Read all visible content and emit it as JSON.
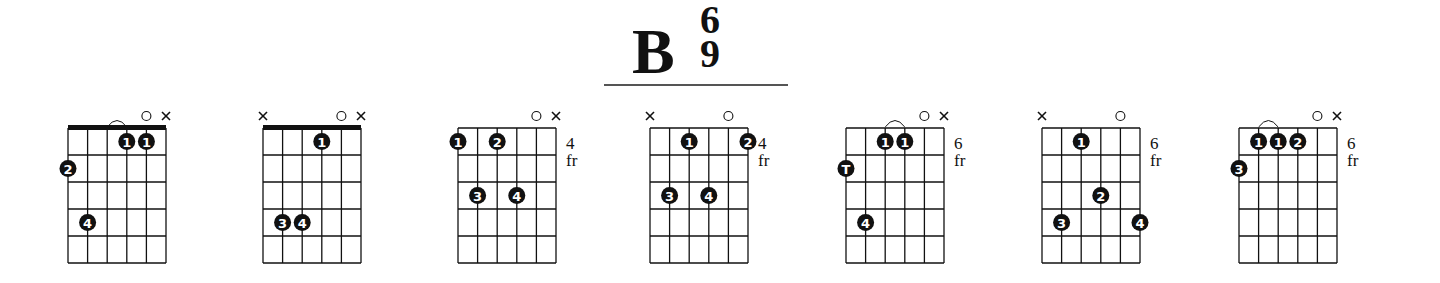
{
  "title": {
    "root": "B",
    "superscript": "6",
    "subscript": "9"
  },
  "grid": {
    "strings": 6,
    "frets": 5,
    "col_spacing": 19.6,
    "row_spacing": 27
  },
  "colors": {
    "ink": "#111111",
    "finger_fill": "#111111",
    "finger_text": "#ffffff"
  },
  "chords": [
    {
      "x": 68,
      "nut": true,
      "fret_label": "",
      "markers": [
        "",
        "",
        "",
        "",
        "open",
        "mute"
      ],
      "barre_arc": [
        2,
        3
      ],
      "fingers": [
        {
          "string": 3,
          "fret": 1,
          "label": "1"
        },
        {
          "string": 4,
          "fret": 1,
          "label": "1"
        },
        {
          "string": 0,
          "fret": 2,
          "label": "2"
        },
        {
          "string": 1,
          "fret": 4,
          "label": "4"
        }
      ]
    },
    {
      "x": 263,
      "nut": true,
      "fret_label": "",
      "markers": [
        "mute",
        "",
        "",
        "",
        "open",
        "mute"
      ],
      "barre_arc": null,
      "fingers": [
        {
          "string": 3,
          "fret": 1,
          "label": "1"
        },
        {
          "string": 1,
          "fret": 4,
          "label": "3"
        },
        {
          "string": 2,
          "fret": 4,
          "label": "4"
        }
      ]
    },
    {
      "x": 458,
      "nut": false,
      "fret_label": "4 fr",
      "markers": [
        "",
        "",
        "",
        "",
        "open",
        "mute"
      ],
      "barre_arc": null,
      "fingers": [
        {
          "string": 0,
          "fret": 1,
          "label": "1"
        },
        {
          "string": 2,
          "fret": 1,
          "label": "2"
        },
        {
          "string": 1,
          "fret": 3,
          "label": "3"
        },
        {
          "string": 3,
          "fret": 3,
          "label": "4"
        }
      ]
    },
    {
      "x": 650,
      "nut": false,
      "fret_label": "4 fr",
      "markers": [
        "mute",
        "",
        "",
        "",
        "open",
        ""
      ],
      "barre_arc": null,
      "fingers": [
        {
          "string": 2,
          "fret": 1,
          "label": "1"
        },
        {
          "string": 5,
          "fret": 1,
          "label": "2"
        },
        {
          "string": 1,
          "fret": 3,
          "label": "3"
        },
        {
          "string": 3,
          "fret": 3,
          "label": "4"
        }
      ]
    },
    {
      "x": 846,
      "nut": false,
      "fret_label": "6 fr",
      "markers": [
        "",
        "",
        "",
        "",
        "open",
        "mute"
      ],
      "barre_arc": [
        2,
        3
      ],
      "fingers": [
        {
          "string": 2,
          "fret": 1,
          "label": "1"
        },
        {
          "string": 3,
          "fret": 1,
          "label": "1"
        },
        {
          "string": 0,
          "fret": 2,
          "label": "T"
        },
        {
          "string": 1,
          "fret": 4,
          "label": "4"
        }
      ]
    },
    {
      "x": 1042,
      "nut": false,
      "fret_label": "6 fr",
      "markers": [
        "mute",
        "",
        "",
        "",
        "open",
        ""
      ],
      "barre_arc": null,
      "fingers": [
        {
          "string": 2,
          "fret": 1,
          "label": "1"
        },
        {
          "string": 3,
          "fret": 3,
          "label": "2"
        },
        {
          "string": 1,
          "fret": 4,
          "label": "3"
        },
        {
          "string": 5,
          "fret": 4,
          "label": "4"
        }
      ]
    },
    {
      "x": 1239,
      "nut": false,
      "fret_label": "6 fr",
      "markers": [
        "",
        "",
        "",
        "",
        "open",
        "mute"
      ],
      "barre_arc": [
        1,
        2
      ],
      "fingers": [
        {
          "string": 1,
          "fret": 1,
          "label": "1"
        },
        {
          "string": 2,
          "fret": 1,
          "label": "1"
        },
        {
          "string": 3,
          "fret": 1,
          "label": "2"
        },
        {
          "string": 0,
          "fret": 2,
          "label": "3"
        }
      ]
    }
  ]
}
